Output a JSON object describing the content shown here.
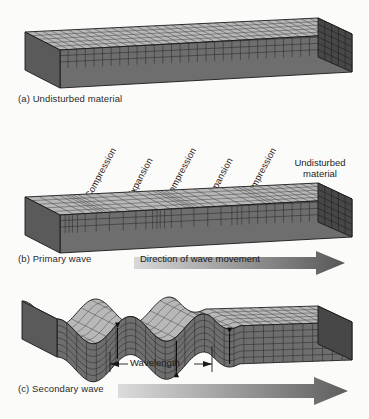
{
  "figure": {
    "background_color": "#fbfbf9"
  },
  "colors": {
    "top_face": "#b9b9b9",
    "front_face": "#6e6e6e",
    "end_face": "#4a4a4a",
    "grid_line": "#2d2d2d",
    "outline": "#1a1a1a",
    "text": "#1e1e1e",
    "arrow_light": "#d6d6d6",
    "arrow_dark": "#595959"
  },
  "panels": [
    {
      "id": "a",
      "caption": "(a) Undisturbed material",
      "caption_label": "a",
      "description": "Uniform rectangular block with evenly spaced grid"
    },
    {
      "id": "b",
      "caption": "(b) Primary wave",
      "caption_label": "b",
      "description": "Block with alternating compressed and expanded grid bands",
      "arrow_label": "Direction of wave movement",
      "zone_labels": [
        "Compression",
        "Expansion",
        "Compression",
        "Expansion",
        "Compression"
      ],
      "undisturbed_label_line1": "Undisturbed",
      "undisturbed_label_line2": "material"
    },
    {
      "id": "c",
      "caption": "(c) Secondary wave",
      "caption_label": "c",
      "description": "Block with sinusoidal transverse displacement and vertical particle-motion arrows",
      "wavelength_label": "Wavelength",
      "arrow_label": ""
    }
  ],
  "chart_data": {
    "type": "diagram",
    "panels": [
      "(a) Undisturbed material",
      "(b) Primary wave",
      "(c) Secondary wave"
    ],
    "p_wave_zones": [
      "Compression",
      "Expansion",
      "Compression",
      "Expansion",
      "Compression",
      "Undisturbed material"
    ],
    "s_wave_measure": "Wavelength",
    "direction_annotation": "Direction of wave movement",
    "wave_cycles_visible": 2.5,
    "grid_columns_undisturbed": 34,
    "grid_rows_front": 6,
    "grid_rows_top": 5
  }
}
